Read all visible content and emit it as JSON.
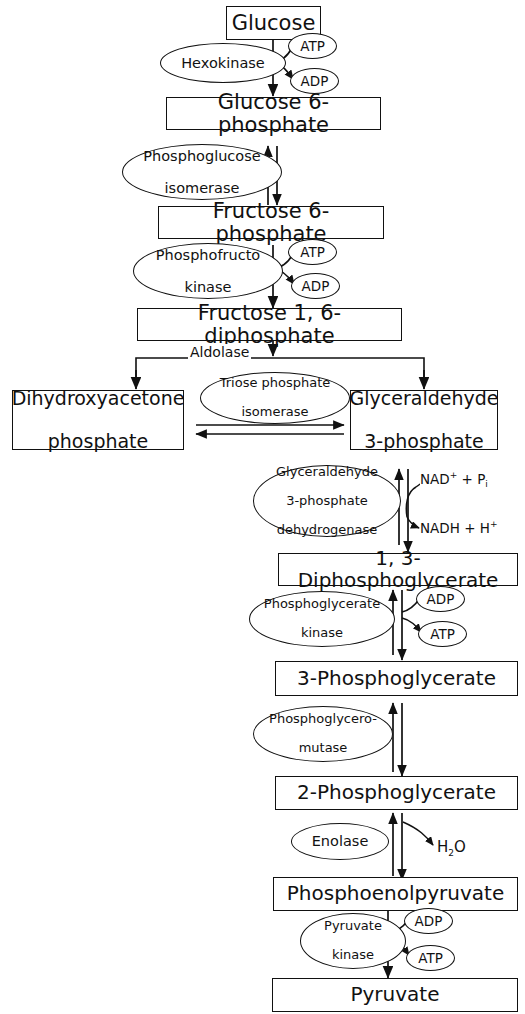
{
  "diagram": {
    "type": "flowchart",
    "metabolites": [
      {
        "id": "glucose",
        "label": "Glucose"
      },
      {
        "id": "g6p",
        "label": "Glucose 6-phosphate"
      },
      {
        "id": "f6p",
        "label": "Fructose 6-phosphate"
      },
      {
        "id": "fbp",
        "label": "Fructose 1, 6-diphosphate"
      },
      {
        "id": "dhap_l1",
        "label": "Dihydroxyacetone"
      },
      {
        "id": "dhap_l2",
        "label": "phosphate"
      },
      {
        "id": "g3p_l1",
        "label": "Glyceraldehyde"
      },
      {
        "id": "g3p_l2",
        "label": "3-phosphate"
      },
      {
        "id": "bpg",
        "label": "1, 3-Diphosphoglycerate"
      },
      {
        "id": "pg3",
        "label": "3-Phosphoglycerate"
      },
      {
        "id": "pg2",
        "label": "2-Phosphoglycerate"
      },
      {
        "id": "pep",
        "label": "Phosphoenolpyruvate"
      },
      {
        "id": "pyruvate",
        "label": "Pyruvate"
      }
    ],
    "enzymes": [
      {
        "id": "hexokinase",
        "line1": "Hexokinase"
      },
      {
        "id": "pgi",
        "line1": "Phosphoglucose",
        "line2": "isomerase"
      },
      {
        "id": "pfk",
        "line1": "Phosphofructo",
        "line2": "kinase"
      },
      {
        "id": "aldolase",
        "line1": "Aldolase"
      },
      {
        "id": "tpi",
        "line1": "Triose phosphate",
        "line2": "isomerase"
      },
      {
        "id": "gapdh",
        "line1": "Glyceraldehyde",
        "line2": "3-phosphate",
        "line3": "dehydrogenase"
      },
      {
        "id": "pgk",
        "line1": "Phosphoglycerate",
        "line2": "kinase"
      },
      {
        "id": "pgm",
        "line1": "Phosphoglycero-",
        "line2": "mutase"
      },
      {
        "id": "enolase",
        "line1": "Enolase"
      },
      {
        "id": "pk",
        "line1": "Pyruvate",
        "line2": "kinase"
      }
    ],
    "cofactors": {
      "atp1": "ATP",
      "adp1": "ADP",
      "atp2": "ATP",
      "adp2": "ADP",
      "adp3": "ADP",
      "atp3": "ATP",
      "adp4": "ADP",
      "atp4": "ATP"
    },
    "chemicals": {
      "nad_in_pre": "NAD",
      "nad_in_sup": "+",
      "nad_in_mid": " + P",
      "nad_in_sub": "i",
      "nadh_out_pre": "NADH + H",
      "nadh_out_sup": "+",
      "water_pre": "H",
      "water_sub": "2",
      "water_post": "O"
    },
    "colors": {
      "ink": "#111111",
      "paper": "#ffffff"
    }
  }
}
